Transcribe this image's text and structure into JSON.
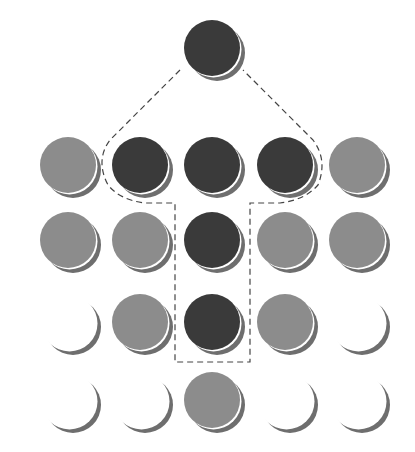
{
  "colors": {
    "dark": "#3a3a3a",
    "gray": "#8c8c8c",
    "empty": "#ffffff",
    "shadow": "#6e6e6e",
    "dash": "#444444"
  },
  "radius": 28,
  "nodes": [
    {
      "id": "top",
      "x": 212,
      "y": 48,
      "type": "dark"
    },
    {
      "id": "r1c1",
      "x": 68,
      "y": 165,
      "type": "gray"
    },
    {
      "id": "r1c2",
      "x": 140,
      "y": 165,
      "type": "dark"
    },
    {
      "id": "r1c3",
      "x": 212,
      "y": 165,
      "type": "dark"
    },
    {
      "id": "r1c4",
      "x": 285,
      "y": 165,
      "type": "dark"
    },
    {
      "id": "r1c5",
      "x": 357,
      "y": 165,
      "type": "gray"
    },
    {
      "id": "r2c1",
      "x": 68,
      "y": 240,
      "type": "gray"
    },
    {
      "id": "r2c2",
      "x": 140,
      "y": 240,
      "type": "gray"
    },
    {
      "id": "r2c3",
      "x": 212,
      "y": 240,
      "type": "dark"
    },
    {
      "id": "r2c4",
      "x": 285,
      "y": 240,
      "type": "gray"
    },
    {
      "id": "r2c5",
      "x": 357,
      "y": 240,
      "type": "gray"
    },
    {
      "id": "r3c1",
      "x": 68,
      "y": 322,
      "type": "empty"
    },
    {
      "id": "r3c2",
      "x": 140,
      "y": 322,
      "type": "gray"
    },
    {
      "id": "r3c3",
      "x": 212,
      "y": 322,
      "type": "dark"
    },
    {
      "id": "r3c4",
      "x": 285,
      "y": 322,
      "type": "gray"
    },
    {
      "id": "r3c5",
      "x": 357,
      "y": 322,
      "type": "empty"
    },
    {
      "id": "r4c1",
      "x": 68,
      "y": 400,
      "type": "empty"
    },
    {
      "id": "r4c2",
      "x": 140,
      "y": 400,
      "type": "empty"
    },
    {
      "id": "r4c3",
      "x": 212,
      "y": 400,
      "type": "gray"
    },
    {
      "id": "r4c4",
      "x": 285,
      "y": 400,
      "type": "empty"
    },
    {
      "id": "r4c5",
      "x": 357,
      "y": 400,
      "type": "empty"
    }
  ],
  "dashed_outline": "M 180 70 L 110 140 Q 95 160 108 185 Q 120 200 145 203 L 175 203 L 175 362 L 250 362 L 250 203 L 280 203 Q 305 200 318 185 Q 328 160 313 140 L 243 70"
}
